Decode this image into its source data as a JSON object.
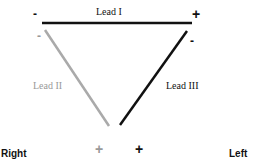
{
  "diagram": {
    "leads": [
      {
        "id": "lead-i",
        "label": "Lead I",
        "color": "#111111",
        "negative": "-",
        "positive": "+"
      },
      {
        "id": "lead-ii",
        "label": "Lead II",
        "color": "#aaaaaa",
        "negative": "-",
        "positive": "+"
      },
      {
        "id": "lead-iii",
        "label": "Lead III",
        "color": "#111111",
        "negative": "-",
        "positive": "+"
      }
    ],
    "sides": {
      "right": "Right",
      "left": "Left"
    }
  }
}
